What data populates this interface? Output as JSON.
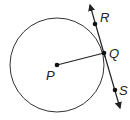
{
  "diagram": {
    "type": "circle-tangent",
    "circle": {
      "center_label": "P",
      "cx": 57,
      "cy": 65,
      "r": 47
    },
    "points": [
      {
        "label": "P",
        "x": 57,
        "y": 65,
        "lx": 46,
        "ly": 80
      },
      {
        "label": "Q",
        "x": 104,
        "y": 53,
        "lx": 109,
        "ly": 58
      },
      {
        "label": "R",
        "x": 95,
        "y": 24,
        "lx": 100,
        "ly": 22
      },
      {
        "label": "S",
        "x": 115,
        "y": 90,
        "lx": 119,
        "ly": 95
      }
    ],
    "radius_segment": "PQ",
    "tangent_line": "RS",
    "stroke_color": "#222222"
  }
}
